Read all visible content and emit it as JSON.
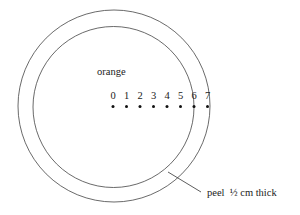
{
  "diagram": {
    "object_label": "orange",
    "scale_labels": [
      "0",
      "1",
      "2",
      "3",
      "4",
      "5",
      "6",
      "7"
    ],
    "peel_label": "peel  ½ cm thick",
    "stroke_color": "#444444",
    "text_color": "#222222"
  }
}
